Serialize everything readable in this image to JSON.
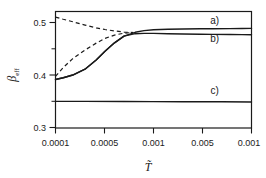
{
  "chart_data": {
    "type": "line",
    "title": "",
    "xlabel": "T̃",
    "ylabel": "β",
    "ylabel_sub": "eff",
    "xscale": "log",
    "grid": false,
    "legend": "inline-annotations",
    "xlim": [
      0.0001,
      0.01
    ],
    "ylim": [
      0.3,
      0.51
    ],
    "xticks": [
      0.0001,
      0.0005,
      0.001,
      0.005,
      0.01
    ],
    "xticklabels": [
      "0.0001",
      "0.0005",
      "0.001",
      "0.005",
      "0.001"
    ],
    "yticks": [
      0.3,
      0.4,
      0.5
    ],
    "yticklabels": [
      "0.3",
      "0.4",
      "0.5"
    ],
    "yticks_minor": [
      0.35,
      0.45
    ],
    "annotations": [
      {
        "text": "a)",
        "x": 0.0042,
        "y": 0.4875
      },
      {
        "text": "b)",
        "x": 0.0042,
        "y": 0.4555
      },
      {
        "text": "c)",
        "x": 0.0042,
        "y": 0.3605
      }
    ],
    "series": [
      {
        "name": "a)",
        "style": "solid",
        "x": [
          0.0001,
          0.00012,
          0.00015,
          0.0002,
          0.00026,
          0.00032,
          0.0004,
          0.0005,
          0.00065,
          0.0008,
          0.001,
          0.0014,
          0.002,
          0.003,
          0.004,
          0.006,
          0.008,
          0.01
        ],
        "y": [
          0.3875,
          0.3905,
          0.3955,
          0.406,
          0.4225,
          0.4385,
          0.4535,
          0.4655,
          0.4725,
          0.4755,
          0.477,
          0.478,
          0.4785,
          0.4788,
          0.479,
          0.4792,
          0.4793,
          0.4795
        ]
      },
      {
        "name": "b)",
        "style": "solid",
        "x": [
          0.0001,
          0.00012,
          0.00015,
          0.0002,
          0.00026,
          0.00032,
          0.0004,
          0.0005,
          0.00065,
          0.0008,
          0.001,
          0.0014,
          0.002,
          0.003,
          0.004,
          0.006,
          0.008,
          0.01
        ],
        "y": [
          0.3875,
          0.3905,
          0.3955,
          0.406,
          0.4225,
          0.4385,
          0.4535,
          0.4655,
          0.47,
          0.4705,
          0.4705,
          0.47,
          0.4695,
          0.469,
          0.4688,
          0.4685,
          0.4683,
          0.468
        ]
      },
      {
        "name": "c)",
        "style": "solid",
        "x": [
          0.0001,
          0.0002,
          0.0005,
          0.001,
          0.002,
          0.005,
          0.01
        ],
        "y": [
          0.348,
          0.348,
          0.3478,
          0.3476,
          0.3474,
          0.3472,
          0.347
        ]
      },
      {
        "name": "upper-dashed",
        "style": "dashed",
        "x": [
          0.0001,
          0.00012,
          0.00015,
          0.0002,
          0.00026,
          0.00032,
          0.0004,
          0.0005,
          0.00062
        ],
        "y": [
          0.5,
          0.496,
          0.4915,
          0.4855,
          0.4805,
          0.4775,
          0.475,
          0.473,
          0.472
        ]
      },
      {
        "name": "lower-dashed",
        "style": "dashed",
        "x": [
          0.0001,
          0.00012,
          0.00015,
          0.0002,
          0.00026,
          0.00032,
          0.0004,
          0.0005,
          0.00062
        ],
        "y": [
          0.393,
          0.409,
          0.425,
          0.4405,
          0.453,
          0.4615,
          0.4675,
          0.471,
          0.4722
        ]
      }
    ]
  }
}
